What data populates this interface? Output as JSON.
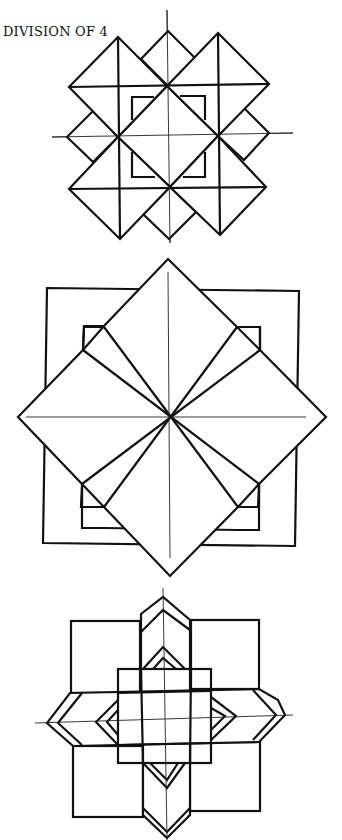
{
  "title": "DIVISION OF 4",
  "figures": [
    {
      "name": "overlapping-diamonds-figure",
      "description": "Grid of overlapping diamonds with central square"
    },
    {
      "name": "rotated-square-star-figure",
      "description": "Square overlaid by a larger diamond with diagonal bands"
    },
    {
      "name": "eight-point-star-figure",
      "description": "Four squares with chevron bands and central square grid"
    }
  ],
  "colors": {
    "stroke": "#111111",
    "background": "#ffffff"
  }
}
